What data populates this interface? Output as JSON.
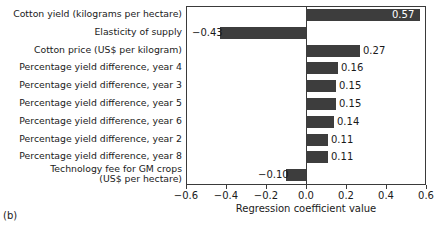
{
  "chart_data": {
    "type": "bar",
    "orientation": "horizontal",
    "title": "",
    "xlabel": "Regression coefficient value",
    "ylabel": "",
    "xlim": [
      -0.6,
      0.6
    ],
    "xticks": [
      "−0.6",
      "−0.4",
      "−0.2",
      "0.0",
      "0.2",
      "0.4",
      "0.6"
    ],
    "xtick_values": [
      -0.6,
      -0.4,
      -0.2,
      0.0,
      0.2,
      0.4,
      0.6
    ],
    "grid": false,
    "legend": false,
    "bar_color": "#3d3d3d",
    "categories": [
      "Cotton yield (kilograms per hectare)",
      "Elasticity of supply",
      "Cotton price (US$ per kilogram)",
      "Percentage yield difference, year 4",
      "Percentage yield difference, year 3",
      "Percentage yield difference, year 5",
      "Percentage yield difference, year 6",
      "Percentage yield difference, year 2",
      "Percentage yield difference, year 8",
      "Technology fee for GM crops\n(US$ per hectare)"
    ],
    "values": [
      0.57,
      -0.43,
      0.27,
      0.16,
      0.15,
      0.15,
      0.14,
      0.11,
      0.11,
      -0.1
    ],
    "value_labels": [
      "0.57",
      "−0.43",
      "0.27",
      "0.16",
      "0.15",
      "0.15",
      "0.14",
      "0.11",
      "0.11",
      "−0.10"
    ],
    "label_placement": [
      "inside-right",
      "outside-left",
      "outside-right",
      "outside-right",
      "outside-right",
      "outside-right",
      "outside-right",
      "outside-right",
      "outside-right",
      "outside-left"
    ]
  },
  "caption": {
    "panel": "(b)"
  }
}
